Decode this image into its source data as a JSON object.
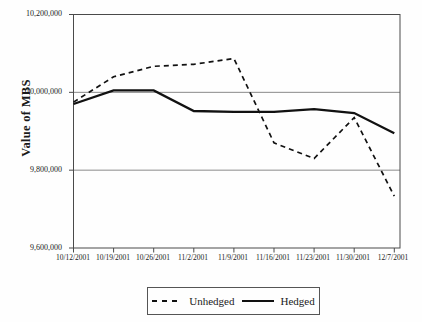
{
  "chart_data": {
    "type": "line",
    "title": "",
    "xlabel": "",
    "ylabel": "Value of MBS",
    "categories": [
      "10/12/2001",
      "10/19/2001",
      "10/26/2001",
      "11/2/2001",
      "11/9/2001",
      "11/16/2001",
      "11/23/2001",
      "11/30/2001",
      "12/7/2001"
    ],
    "series": [
      {
        "name": "Unhedged",
        "style": "dashed",
        "values": [
          9975000,
          10040000,
          10067000,
          10072000,
          10087000,
          9870000,
          9830000,
          9935000,
          9733000
        ]
      },
      {
        "name": "Hedged",
        "style": "solid",
        "values": [
          9970000,
          10005000,
          10005000,
          9952000,
          9950000,
          9950000,
          9957000,
          9947000,
          9895000
        ]
      }
    ],
    "ylim": [
      9600000,
      10200000
    ],
    "yticks": [
      10200000,
      10000000,
      9800000,
      9600000
    ],
    "ytick_labels": [
      "10,200,000",
      "10,000,000",
      "9,800,000",
      "9,600,000"
    ],
    "grid": true,
    "legend_position": "bottom"
  },
  "colors": {
    "line": "#111111",
    "frame": "#4a4a4a",
    "gridline": "#8a8a8a",
    "text": "#1a1a1a",
    "background": "#fefefe"
  }
}
